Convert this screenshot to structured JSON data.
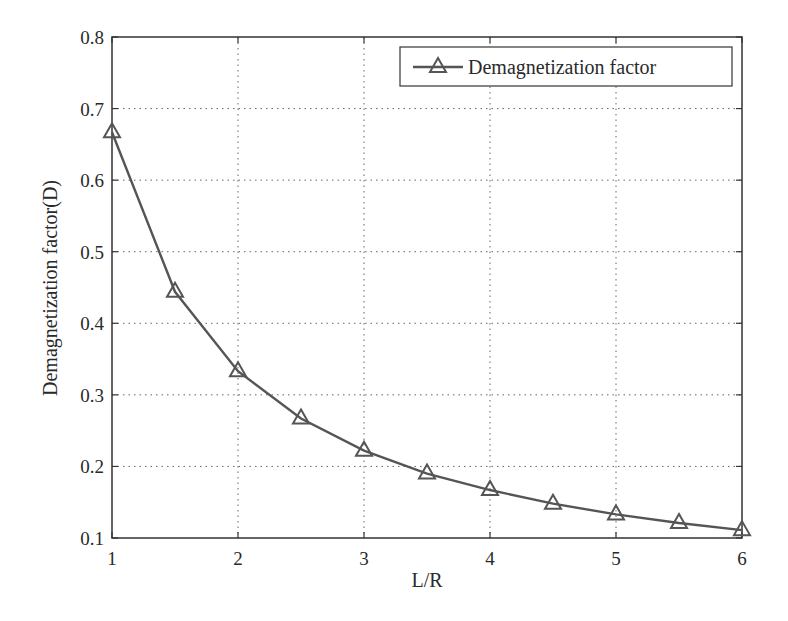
{
  "chart_data": {
    "type": "line",
    "title": "",
    "xlabel": "L/R",
    "ylabel": "Demagnetization factor(D)",
    "xlim": [
      1,
      6
    ],
    "ylim": [
      0.1,
      0.8
    ],
    "xticks": [
      1,
      2,
      3,
      4,
      5,
      6
    ],
    "xtick_labels": [
      "1",
      "2",
      "3",
      "4",
      "5",
      "6"
    ],
    "yticks": [
      0.1,
      0.2,
      0.3,
      0.4,
      0.5,
      0.6,
      0.7,
      0.8
    ],
    "ytick_labels": [
      "0.1",
      "0.2",
      "0.3",
      "0.4",
      "0.5",
      "0.6",
      "0.7",
      "0.8"
    ],
    "grid": true,
    "grid_style": "dotted",
    "legend_position": "upper right",
    "x": [
      1,
      1.5,
      2,
      2.5,
      3,
      3.5,
      4,
      4.5,
      5,
      5.5,
      6
    ],
    "series": [
      {
        "name": "Demagnetization factor",
        "marker": "triangle",
        "color": "#555555",
        "values": [
          0.667,
          0.444,
          0.333,
          0.267,
          0.222,
          0.19,
          0.167,
          0.148,
          0.133,
          0.121,
          0.111
        ]
      }
    ]
  },
  "colors": {
    "line": "#555555",
    "axis": "#333333",
    "grid": "#555555"
  }
}
